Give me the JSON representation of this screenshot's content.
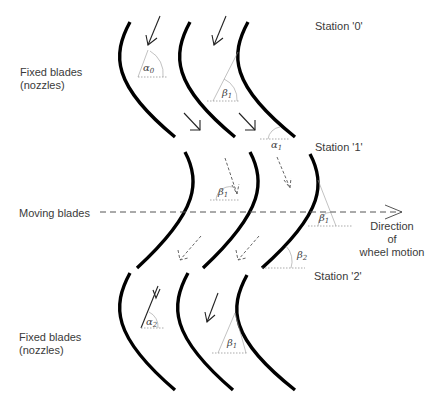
{
  "diagram": {
    "labels": {
      "fixed_blades_top": [
        "Fixed blades",
        "(nozzles)"
      ],
      "moving_blades": "Moving blades",
      "fixed_blades_bottom": [
        "Fixed blades",
        "(nozzles)"
      ],
      "direction": [
        "Direction",
        "of",
        "wheel motion"
      ],
      "station_0": "Station '0'",
      "station_1": "Station '1'",
      "station_2": "Station '2'"
    },
    "angles": {
      "alpha0": {
        "symbol": "α",
        "sub": "0"
      },
      "beta1_top": {
        "symbol": "β",
        "sub": "1"
      },
      "alpha1": {
        "symbol": "α",
        "sub": "1"
      },
      "beta1_mid_left": {
        "symbol": "β",
        "sub": "1"
      },
      "beta1_mid_right": {
        "symbol": "β",
        "sub": "1"
      },
      "beta2": {
        "symbol": "β",
        "sub": "2"
      },
      "alpha2": {
        "symbol": "α",
        "sub": "2"
      },
      "beta1_bottom": {
        "symbol": "β",
        "sub": "1"
      }
    },
    "rows": [
      {
        "name": "fixed-blades-row-1",
        "blade_count": 3
      },
      {
        "name": "moving-blades-row",
        "blade_count": 3
      },
      {
        "name": "fixed-blades-row-2",
        "blade_count": 3
      }
    ]
  }
}
